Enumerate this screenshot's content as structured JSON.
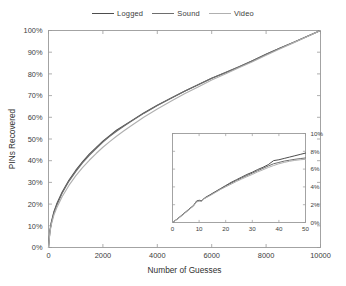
{
  "chart_data": {
    "type": "line",
    "title": "",
    "xlabel": "Number of Guesses",
    "ylabel": "PINs Recovered",
    "xlim": [
      0,
      10000
    ],
    "ylim": [
      0,
      100
    ],
    "xticks": [
      0,
      2000,
      4000,
      6000,
      8000,
      10000
    ],
    "xticklabels": [
      "0",
      "2000",
      "4000",
      "6000",
      "8000",
      "10000"
    ],
    "yticks": [
      0,
      10,
      20,
      30,
      40,
      50,
      60,
      70,
      80,
      90,
      100
    ],
    "yticklabels": [
      "0%",
      "10%",
      "20%",
      "30%",
      "40%",
      "50%",
      "60%",
      "70%",
      "80%",
      "90%",
      "100%"
    ],
    "grid": false,
    "legend_position": "top-center",
    "legend": [
      "Logged",
      "Sound",
      "Video"
    ],
    "series": [
      {
        "name": "Logged",
        "color": "#4d4d4d",
        "x": [
          0,
          50,
          100,
          200,
          300,
          500,
          750,
          1000,
          1250,
          1500,
          1750,
          2000,
          2250,
          2500,
          2750,
          3000,
          3500,
          4000,
          4500,
          5000,
          5500,
          6000,
          6500,
          7000,
          7500,
          8000,
          8500,
          9000,
          9500,
          10000
        ],
        "y": [
          0,
          7.5,
          11.5,
          16.5,
          20.0,
          25.5,
          31.0,
          35.5,
          39.5,
          43.0,
          46.0,
          49.0,
          51.5,
          54.0,
          56.0,
          58.0,
          62.0,
          65.5,
          68.8,
          72.0,
          75.0,
          78.0,
          80.5,
          83.2,
          86.0,
          89.0,
          91.8,
          94.5,
          97.2,
          100.0
        ]
      },
      {
        "name": "Sound",
        "color": "#6e6e6e",
        "x": [
          0,
          50,
          100,
          200,
          300,
          500,
          750,
          1000,
          1250,
          1500,
          1750,
          2000,
          2250,
          2500,
          2750,
          3000,
          3500,
          4000,
          4500,
          5000,
          5500,
          6000,
          6500,
          7000,
          7500,
          8000,
          8500,
          9000,
          9500,
          10000
        ],
        "y": [
          0,
          7.2,
          11.0,
          16.0,
          19.4,
          25.0,
          30.5,
          35.0,
          39.0,
          42.5,
          45.6,
          48.6,
          51.2,
          53.6,
          55.8,
          57.8,
          61.8,
          65.4,
          68.8,
          72.0,
          75.0,
          78.0,
          80.6,
          83.3,
          86.1,
          89.0,
          91.8,
          94.5,
          97.2,
          100.0
        ]
      },
      {
        "name": "Video",
        "color": "#b0b0b0",
        "x": [
          0,
          50,
          100,
          200,
          300,
          500,
          750,
          1000,
          1250,
          1500,
          1750,
          2000,
          2250,
          2500,
          2750,
          3000,
          3500,
          4000,
          4500,
          5000,
          5500,
          6000,
          6500,
          7000,
          7500,
          8000,
          8500,
          9000,
          9500,
          10000
        ],
        "y": [
          0,
          6.8,
          10.4,
          15.0,
          18.2,
          23.4,
          28.6,
          33.0,
          36.8,
          40.2,
          43.3,
          46.2,
          48.8,
          51.3,
          53.6,
          55.8,
          60.0,
          63.8,
          67.4,
          70.8,
          74.0,
          77.2,
          80.0,
          82.8,
          85.6,
          88.6,
          91.5,
          94.3,
          97.1,
          100.0
        ]
      }
    ],
    "inset": {
      "type": "line",
      "xlim": [
        0,
        50
      ],
      "ylim": [
        0,
        10
      ],
      "xticks": [
        0,
        10,
        20,
        30,
        40,
        50
      ],
      "xticklabels": [
        "0",
        "10",
        "20",
        "30",
        "40",
        "50"
      ],
      "yticks": [
        0,
        2,
        4,
        6,
        8,
        10
      ],
      "yticklabels": [
        "0%",
        "2%",
        "4%",
        "6%",
        "8%",
        "10%"
      ],
      "yaxis_side": "right",
      "grid": false,
      "series": [
        {
          "name": "Logged",
          "color": "#4d4d4d",
          "x": [
            0,
            2,
            4,
            6,
            8,
            9,
            10,
            11,
            12,
            14,
            16,
            18,
            20,
            22,
            24,
            26,
            28,
            30,
            32,
            34,
            36,
            38,
            40,
            42,
            44,
            46,
            48,
            50
          ],
          "y": [
            0,
            0.45,
            0.95,
            1.45,
            1.95,
            2.4,
            2.5,
            2.45,
            2.75,
            3.1,
            3.45,
            3.8,
            4.15,
            4.5,
            4.8,
            5.1,
            5.4,
            5.65,
            5.95,
            6.2,
            6.5,
            6.95,
            7.05,
            7.2,
            7.35,
            7.5,
            7.65,
            7.8
          ]
        },
        {
          "name": "Sound",
          "color": "#6e6e6e",
          "x": [
            0,
            2,
            4,
            6,
            8,
            9,
            10,
            11,
            12,
            14,
            16,
            18,
            20,
            22,
            24,
            26,
            28,
            30,
            32,
            34,
            36,
            38,
            40,
            42,
            44,
            46,
            48,
            50
          ],
          "y": [
            0,
            0.42,
            0.9,
            1.4,
            1.9,
            2.35,
            2.45,
            2.4,
            2.7,
            3.05,
            3.4,
            3.75,
            4.1,
            4.42,
            4.72,
            5.0,
            5.28,
            5.55,
            5.82,
            6.08,
            6.35,
            6.6,
            6.75,
            6.9,
            7.0,
            7.1,
            7.18,
            7.25
          ]
        },
        {
          "name": "Video",
          "color": "#b0b0b0",
          "x": [
            0,
            2,
            4,
            6,
            8,
            9,
            10,
            11,
            12,
            14,
            16,
            18,
            20,
            22,
            24,
            26,
            28,
            30,
            32,
            34,
            36,
            38,
            40,
            42,
            44,
            46,
            48,
            50
          ],
          "y": [
            0,
            0.4,
            0.88,
            1.38,
            1.88,
            2.3,
            2.4,
            2.38,
            2.68,
            3.0,
            3.35,
            3.7,
            4.0,
            4.3,
            4.6,
            4.88,
            5.15,
            5.4,
            5.68,
            5.92,
            6.18,
            6.4,
            6.6,
            6.75,
            6.88,
            6.98,
            7.05,
            7.1
          ]
        }
      ]
    }
  }
}
